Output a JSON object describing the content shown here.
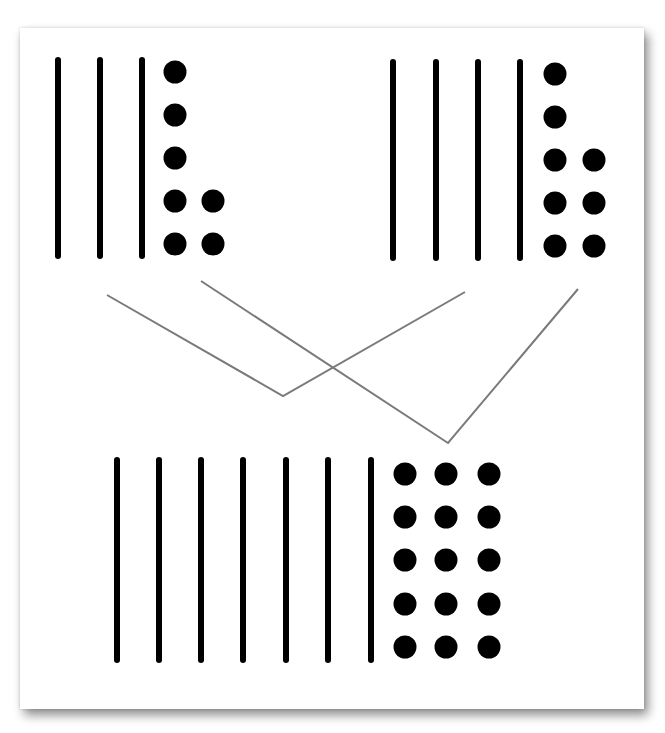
{
  "diagram": {
    "colors": {
      "marks": "#000000",
      "connector": "#7a7a7a",
      "card": "#ffffff",
      "shadow": "#8c8c8c"
    },
    "groups": [
      {
        "id": "top-left",
        "tens": 3,
        "ones": 7,
        "value": 37,
        "stick_x": [
          58,
          100,
          142
        ],
        "stick_y": [
          60,
          256
        ],
        "dot_cols": [
          {
            "x": 175,
            "rows_y": [
              72,
              115,
              158,
              201,
              244
            ]
          },
          {
            "x": 213,
            "rows_y": [
              201,
              244
            ]
          }
        ]
      },
      {
        "id": "top-right",
        "tens": 4,
        "ones": 8,
        "value": 48,
        "stick_x": [
          393,
          436,
          478,
          520
        ],
        "stick_y": [
          62,
          258
        ],
        "dot_cols": [
          {
            "x": 555,
            "rows_y": [
              74,
              117,
              160,
              203,
              246
            ]
          },
          {
            "x": 594,
            "rows_y": [
              160,
              203,
              246
            ]
          }
        ]
      },
      {
        "id": "bottom",
        "tens": 7,
        "ones": 15,
        "value": 85,
        "stick_x": [
          117,
          159,
          201,
          243,
          286,
          328,
          371
        ],
        "stick_y": [
          460,
          660
        ],
        "dot_cols": [
          {
            "x": 405,
            "rows_y": [
              474,
              517,
              560,
              604,
              647
            ]
          },
          {
            "x": 446,
            "rows_y": [
              474,
              517,
              560,
              604,
              647
            ]
          },
          {
            "x": 489,
            "rows_y": [
              474,
              517,
              560,
              604,
              647
            ]
          }
        ]
      }
    ],
    "connectors": [
      {
        "id": "tens-join",
        "points": [
          [
            107,
            295
          ],
          [
            283,
            396
          ],
          [
            465,
            292
          ]
        ]
      },
      {
        "id": "ones-join",
        "points": [
          [
            201,
            281
          ],
          [
            448,
            443
          ],
          [
            578,
            289
          ]
        ]
      }
    ]
  }
}
